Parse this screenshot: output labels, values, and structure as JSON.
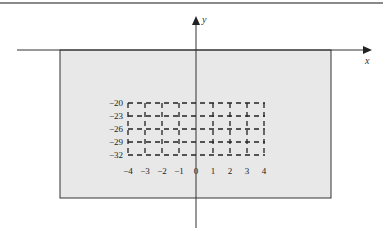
{
  "diagram": {
    "x_axis_label": "x",
    "y_axis_label": "y",
    "region_fill": "#e8e8e8",
    "grid": {
      "x_range": [
        -4,
        4
      ],
      "y_range": [
        -32,
        -20
      ],
      "x_ticks": [
        "−4",
        "−3",
        "−2",
        "−1",
        "0",
        "1",
        "2",
        "3",
        "4"
      ],
      "y_ticks": [
        "−20",
        "−23",
        "−26",
        "−29",
        "−32"
      ],
      "line_style": "dashed"
    }
  }
}
